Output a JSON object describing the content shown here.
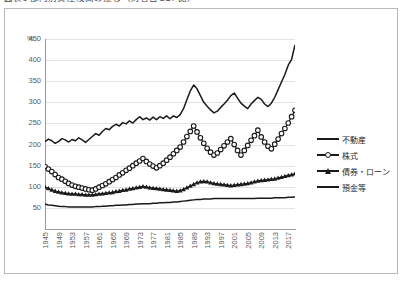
{
  "caption": {
    "text": "図表3  部門別資産残高の推移（対名目GDP比）"
  },
  "chart_data": {
    "type": "line",
    "title": "",
    "xlabel": "",
    "ylabel": "%",
    "ylim": [
      0,
      450
    ],
    "ytick_values": [
      50,
      100,
      150,
      200,
      250,
      300,
      350,
      400,
      450
    ],
    "ytick_labels": [
      "50",
      "100",
      "150",
      "200",
      "250",
      "300",
      "350",
      "400",
      "450"
    ],
    "grid": true,
    "legend_position": "right",
    "x_axis_unit_label": "%",
    "xtick_labels": [
      "1945",
      "1949",
      "1953",
      "1957",
      "1961",
      "1965",
      "1969",
      "1973",
      "1977",
      "1981",
      "1985",
      "1989",
      "1993",
      "1997",
      "2001",
      "2005",
      "2009",
      "2013",
      "2017"
    ],
    "x_start": 1945,
    "x_end": 2019,
    "x": [
      1945,
      1946,
      1947,
      1948,
      1949,
      1950,
      1951,
      1952,
      1953,
      1954,
      1955,
      1956,
      1957,
      1958,
      1959,
      1960,
      1961,
      1962,
      1963,
      1964,
      1965,
      1966,
      1967,
      1968,
      1969,
      1970,
      1971,
      1972,
      1973,
      1974,
      1975,
      1976,
      1977,
      1978,
      1979,
      1980,
      1981,
      1982,
      1983,
      1984,
      1985,
      1986,
      1987,
      1988,
      1989,
      1990,
      1991,
      1992,
      1993,
      1994,
      1995,
      1996,
      1997,
      1998,
      1999,
      2000,
      2001,
      2002,
      2003,
      2004,
      2005,
      2006,
      2007,
      2008,
      2009,
      2010,
      2011,
      2012,
      2013,
      2014,
      2015,
      2016,
      2017,
      2018,
      2019
    ],
    "series": [
      {
        "name": "不動産",
        "marker": "none",
        "values": [
          207,
          213,
          209,
          203,
          207,
          214,
          211,
          206,
          212,
          209,
          216,
          211,
          205,
          212,
          219,
          226,
          222,
          231,
          238,
          235,
          243,
          248,
          244,
          252,
          249,
          256,
          251,
          259,
          266,
          259,
          263,
          258,
          265,
          259,
          266,
          262,
          268,
          261,
          268,
          264,
          271,
          285,
          306,
          327,
          341,
          332,
          316,
          300,
          291,
          282,
          275,
          279,
          288,
          296,
          305,
          316,
          322,
          310,
          298,
          291,
          285,
          296,
          304,
          312,
          307,
          296,
          290,
          298,
          312,
          330,
          348,
          366,
          388,
          402,
          436
        ]
      },
      {
        "name": "株式",
        "marker": "circle",
        "values": [
          148,
          142,
          136,
          129,
          122,
          118,
          113,
          108,
          104,
          101,
          99,
          97,
          95,
          93,
          92,
          95,
          99,
          103,
          107,
          112,
          117,
          122,
          128,
          133,
          139,
          144,
          150,
          156,
          161,
          167,
          160,
          154,
          149,
          145,
          150,
          156,
          163,
          170,
          178,
          186,
          194,
          206,
          219,
          231,
          244,
          230,
          216,
          203,
          191,
          182,
          175,
          180,
          188,
          197,
          206,
          214,
          200,
          186,
          175,
          186,
          198,
          210,
          221,
          234,
          218,
          206,
          196,
          190,
          201,
          213,
          226,
          238,
          251,
          266,
          281
        ]
      },
      {
        "name": "債券・ローン",
        "marker": "triangle",
        "values": [
          100,
          96,
          93,
          90,
          88,
          86,
          85,
          84,
          83,
          83,
          82,
          82,
          81,
          81,
          81,
          82,
          83,
          84,
          85,
          86,
          87,
          89,
          90,
          92,
          93,
          95,
          96,
          98,
          99,
          101,
          100,
          98,
          97,
          96,
          95,
          94,
          93,
          92,
          91,
          90,
          91,
          94,
          98,
          102,
          106,
          110,
          112,
          113,
          112,
          110,
          108,
          107,
          106,
          105,
          104,
          103,
          104,
          105,
          106,
          107,
          108,
          110,
          112,
          114,
          115,
          116,
          117,
          118,
          119,
          121,
          123,
          125,
          127,
          129,
          131
        ]
      },
      {
        "name": "預金等",
        "marker": "none",
        "values": [
          59,
          57,
          56,
          55,
          54,
          53,
          53,
          52,
          52,
          52,
          52,
          52,
          52,
          52,
          52,
          53,
          53,
          54,
          54,
          55,
          55,
          56,
          56,
          57,
          57,
          58,
          58,
          59,
          59,
          60,
          60,
          60,
          61,
          61,
          62,
          62,
          63,
          63,
          64,
          64,
          65,
          66,
          67,
          68,
          69,
          70,
          70,
          71,
          71,
          71,
          72,
          72,
          72,
          72,
          72,
          72,
          72,
          72,
          72,
          72,
          72,
          72,
          72,
          73,
          73,
          73,
          73,
          73,
          74,
          74,
          74,
          74,
          75,
          75,
          76
        ]
      }
    ]
  },
  "legend": {
    "items": [
      {
        "label": "不動産",
        "marker": "none"
      },
      {
        "label": "株式",
        "marker": "circle"
      },
      {
        "label": "債券・ローン",
        "marker": "triangle"
      },
      {
        "label": "預金等",
        "marker": "none"
      }
    ]
  }
}
